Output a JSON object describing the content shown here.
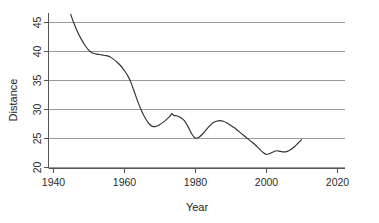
{
  "chart_data": {
    "type": "line",
    "title": "",
    "xlabel": "Year",
    "ylabel": "Distance",
    "xlim": [
      1940,
      2020
    ],
    "ylim": [
      20,
      46.5
    ],
    "xticks": [
      1940,
      1960,
      1980,
      2000,
      2020
    ],
    "yticks": [
      20,
      25,
      30,
      35,
      40,
      45
    ],
    "xtick_labels": [
      "1940",
      "1960",
      "1980",
      "2000",
      "2020"
    ],
    "ytick_labels": [
      "20",
      "25",
      "30",
      "35",
      "40",
      "45"
    ],
    "grid": "horizontal",
    "legend": "none",
    "series": [
      {
        "name": "Distance",
        "color": "#333333",
        "x": [
          1945.0,
          1946.0,
          1947.0,
          1948.0,
          1949.0,
          1950.0,
          1951.0,
          1952.0,
          1953.0,
          1954.0,
          1955.0,
          1956.0,
          1957.0,
          1958.0,
          1959.0,
          1960.0,
          1961.0,
          1962.0,
          1963.0,
          1964.0,
          1965.0,
          1966.0,
          1967.0,
          1968.0,
          1969.0,
          1970.0,
          1971.0,
          1972.0,
          1973.0,
          1973.5,
          1974.0,
          1975.0,
          1976.0,
          1977.0,
          1978.0,
          1979.0,
          1980.0,
          1981.0,
          1982.0,
          1983.0,
          1984.0,
          1985.0,
          1986.0,
          1987.0,
          1988.0,
          1989.0,
          1990.0,
          1991.0,
          1992.0,
          1993.0,
          1994.0,
          1995.0,
          1996.0,
          1997.0,
          1998.0,
          1999.0,
          2000.0,
          2001.0,
          2002.0,
          2003.0,
          2004.0,
          2005.0,
          2006.0,
          2007.0,
          2008.0,
          2009.0,
          2010.0
        ],
        "y": [
          46.3,
          44.6,
          43.2,
          42.0,
          41.0,
          40.2,
          39.7,
          39.5,
          39.4,
          39.3,
          39.2,
          39.0,
          38.6,
          38.1,
          37.5,
          36.7,
          35.8,
          34.5,
          32.8,
          31.1,
          29.6,
          28.4,
          27.5,
          27.0,
          27.0,
          27.3,
          27.7,
          28.2,
          28.8,
          29.2,
          28.9,
          28.8,
          28.5,
          28.0,
          27.0,
          25.8,
          25.0,
          25.1,
          25.6,
          26.3,
          27.0,
          27.6,
          27.9,
          28.0,
          27.9,
          27.6,
          27.2,
          26.8,
          26.3,
          25.8,
          25.3,
          24.8,
          24.3,
          23.8,
          23.2,
          22.6,
          22.2,
          22.3,
          22.6,
          22.8,
          22.7,
          22.6,
          22.7,
          23.0,
          23.5,
          24.1,
          24.7
        ]
      }
    ]
  },
  "axes": {
    "x_axis_label": "Year",
    "y_axis_label": "Distance"
  },
  "colors": {
    "line": "#333333",
    "grid": "#9a9a9a",
    "axis": "#555555",
    "text": "#1c1c1c",
    "background": "#ffffff"
  }
}
